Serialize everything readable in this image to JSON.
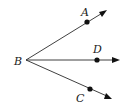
{
  "diagram": {
    "type": "geometry-rays",
    "vertex": {
      "label": "B",
      "x": 26,
      "y": 60,
      "label_x": 14,
      "label_y": 65
    },
    "rays": [
      {
        "name": "BA",
        "point": {
          "label": "A",
          "x": 87,
          "y": 22,
          "label_x": 81,
          "label_y": 16
        },
        "end": {
          "x": 106,
          "y": 11
        }
      },
      {
        "name": "BD",
        "point": {
          "label": "D",
          "x": 97,
          "y": 60,
          "label_x": 93,
          "label_y": 53
        },
        "end": {
          "x": 119,
          "y": 60
        }
      },
      {
        "name": "BC",
        "point": {
          "label": "C",
          "x": 90,
          "y": 89,
          "label_x": 76,
          "label_y": 102
        },
        "end": {
          "x": 111,
          "y": 98
        }
      }
    ],
    "colors": {
      "line": "#2a2a2a",
      "point": "#111111",
      "background": "#ffffff"
    }
  }
}
